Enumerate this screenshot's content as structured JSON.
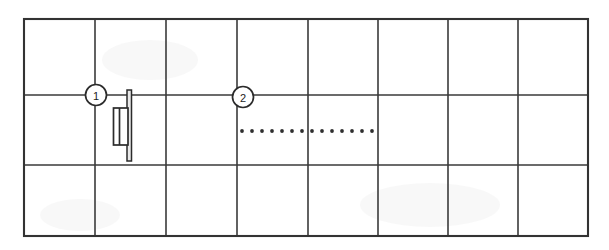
{
  "figure": {
    "type": "technical-line-drawing",
    "title": "",
    "background_color": "#ffffff",
    "line_color": "#333333",
    "width": 609,
    "height": 250
  },
  "grid": {
    "name": "panel-grid",
    "columns": 8,
    "rows": 3,
    "x_lines": [
      24,
      95,
      166,
      237,
      308,
      378,
      448,
      518,
      588
    ],
    "y_lines": [
      19,
      95,
      165,
      236
    ],
    "left": 24,
    "top": 19,
    "right": 588,
    "bottom": 236
  },
  "callouts": [
    {
      "id": "callout-1",
      "label": "1",
      "cx": 96,
      "cy": 95,
      "r": 10.5
    },
    {
      "id": "callout-2",
      "label": "2",
      "cx": 243,
      "cy": 97,
      "r": 10.5
    }
  ],
  "detail_symbol": {
    "name": "door-hinge-detail",
    "blade": {
      "x": 127,
      "y": 90,
      "width": 4.5,
      "height": 71
    },
    "panel": {
      "x": 113.5,
      "y": 108,
      "width": 14.5,
      "height": 37
    },
    "panel_inner_line_x": 119.5
  },
  "dotted_line": {
    "name": "hidden-edge-dotted-line",
    "y": 131,
    "x_start": 242,
    "x_end": 372,
    "dot_count": 14,
    "dot_radius": 1.9,
    "dot_color": "#2f2f2f"
  }
}
